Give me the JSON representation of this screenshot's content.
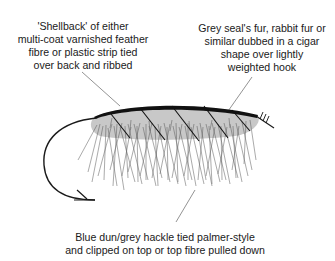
{
  "diagram": {
    "colors": {
      "body_fill": "#c8c8c8",
      "shellback": "#111111",
      "hackle_fibres": "#555555",
      "hook": "#1a1a1a",
      "leader_lines": "#777777"
    }
  },
  "labels": {
    "shellback": {
      "lines": [
        "'Shellback' of either",
        "multi-coat varnished feather",
        "fibre or plastic strip tied",
        "over back and ribbed"
      ]
    },
    "body": {
      "lines": [
        "Grey seal's fur, rabbit fur or",
        "similar dubbed in a cigar",
        "shape over lightly",
        "weighted hook"
      ]
    },
    "hackle": {
      "lines": [
        "Blue dun/grey hackle tied palmer-style",
        "and clipped on top or top fibre pulled down"
      ]
    }
  }
}
